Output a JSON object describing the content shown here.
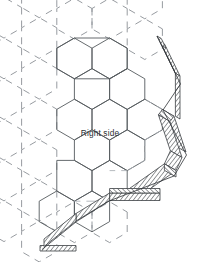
{
  "diagram": {
    "kind": "hexagonal-grid-diagram",
    "background_color": "#ffffff",
    "stroke_color_solid": "#555a5e",
    "stroke_color_dashed": "#8b9095",
    "stroke_color_band": "#3b3f43",
    "labels": [
      {
        "id": "right-side",
        "text": "Right side",
        "x": 100,
        "y": 136
      }
    ],
    "hex_geometry": {
      "orientation": "flat-top",
      "radius": 23.5,
      "column_pitch": 35.2,
      "row_pitch": 40.7,
      "origin_x": 92,
      "origin_y": 68
    },
    "solid_cells": [
      {
        "col": 0,
        "row": 0
      },
      {
        "col": 0,
        "row": 1
      },
      {
        "col": 0,
        "row": 2
      },
      {
        "col": 1,
        "row": 0
      },
      {
        "col": 1,
        "row": 1
      },
      {
        "col": 1,
        "row": -1
      }
    ],
    "dashed_cells": [
      {
        "col": -1,
        "row": -1
      },
      {
        "col": -1,
        "row": 0
      },
      {
        "col": -1,
        "row": 1
      },
      {
        "col": -1,
        "row": 2
      },
      {
        "col": -2,
        "row": -1
      },
      {
        "col": -2,
        "row": 0
      },
      {
        "col": -2,
        "row": 1
      },
      {
        "col": -2,
        "row": 2
      },
      {
        "col": 0,
        "row": -1
      },
      {
        "col": 1,
        "row": 2
      }
    ],
    "extruded_band": {
      "description": "hatched 3D extruded rim tracing the right and lower boundary of the solid hex cluster",
      "depth_x": 12,
      "depth_y": 10,
      "hatch_fill": "#3b3f43"
    }
  }
}
